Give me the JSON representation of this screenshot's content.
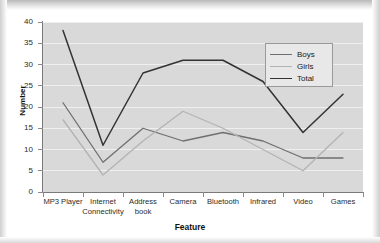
{
  "chart_data": {
    "type": "line",
    "title": "",
    "xlabel": "Feature",
    "ylabel": "Number",
    "ylim": [
      0,
      40
    ],
    "ytick_step": 5,
    "grid": true,
    "legend_position": "top-right",
    "categories": [
      "MP3 Player",
      "Internet Connectivity",
      "Address book",
      "Camera",
      "Bluetooth",
      "Infrared",
      "Video",
      "Games"
    ],
    "category_lines": [
      [
        "MP3 Player"
      ],
      [
        "Internet",
        "Connectivity"
      ],
      [
        "Address",
        "book"
      ],
      [
        "Camera"
      ],
      [
        "Bluetooth"
      ],
      [
        "Infrared"
      ],
      [
        "Video"
      ],
      [
        "Games"
      ]
    ],
    "ytick_labels": [
      "0",
      "5",
      "10",
      "15",
      "20",
      "25",
      "30",
      "35",
      "40"
    ],
    "series": [
      {
        "name": "Boys",
        "color": "#6f6f6f",
        "values": [
          21,
          7,
          15,
          12,
          14,
          12,
          8,
          8
        ]
      },
      {
        "name": "Girls",
        "color": "#b3b3b3",
        "values": [
          17,
          4,
          12,
          19,
          15,
          10,
          5,
          14
        ]
      },
      {
        "name": "Total",
        "color": "#333333",
        "values": [
          38,
          11,
          28,
          31,
          31,
          26,
          14,
          23
        ]
      }
    ]
  },
  "legend": {
    "entries": [
      {
        "label": "Boys"
      },
      {
        "label": "Girls"
      },
      {
        "label": "Total"
      }
    ]
  },
  "colors": {
    "plot_background": "#d9d9d9",
    "gridline": "#efefef",
    "axis": "#7a7a7a",
    "boys": "#6f6f6f",
    "girls": "#b3b3b3",
    "total": "#333333"
  }
}
